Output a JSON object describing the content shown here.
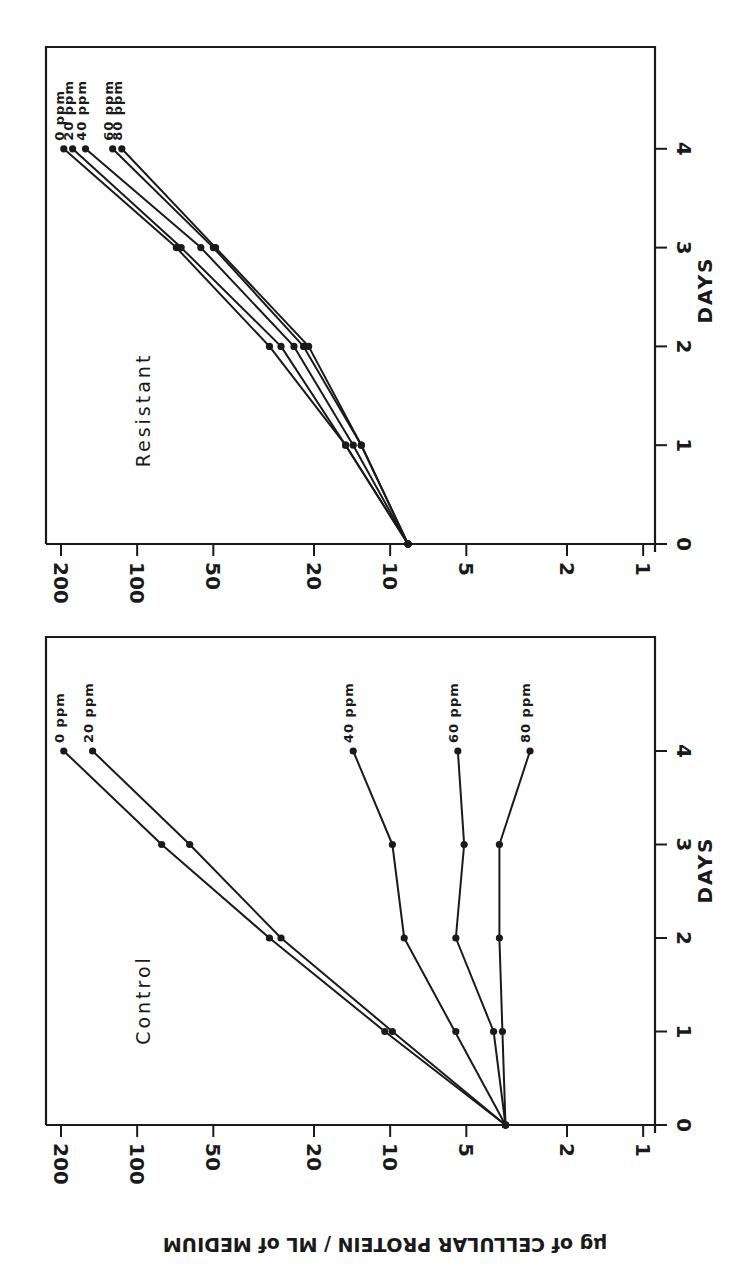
{
  "figure": {
    "orientation_note": "figure printed rotated 90 degrees clockwise",
    "y_axis_title": "µg of CELLULAR PROTEIN / ML of MEDIUM",
    "x_axis_title": "DAYS",
    "colors": {
      "ink": "#1a1a1a",
      "background": "#ffffff"
    }
  },
  "chart_data": [
    {
      "type": "line",
      "title": "Resistant",
      "xlabel": "DAYS",
      "ylabel": "µg of CELLULAR PROTEIN / ML of MEDIUM",
      "x": [
        0,
        1,
        2,
        3,
        4
      ],
      "x_ticks": [
        "0",
        "1",
        "2",
        "3",
        "4"
      ],
      "xlim": [
        0,
        5
      ],
      "y_scale": "log",
      "y_ticks": [
        "1",
        "2",
        "5",
        "10",
        "20",
        "50",
        "100",
        "200"
      ],
      "ylim": [
        1,
        220
      ],
      "grid": false,
      "legend": "inline labels at line ends",
      "series": [
        {
          "name": "0 ppm",
          "values": [
            8.5,
            15,
            30,
            70,
            195
          ]
        },
        {
          "name": "20 ppm",
          "values": [
            8.5,
            15,
            27,
            67,
            180
          ]
        },
        {
          "name": "40 ppm",
          "values": [
            8.5,
            14,
            24,
            56,
            160
          ]
        },
        {
          "name": "60 ppm",
          "values": [
            8.5,
            13,
            22,
            50,
            125
          ]
        },
        {
          "name": "80 ppm",
          "values": [
            8.5,
            13,
            21,
            49,
            115
          ]
        }
      ]
    },
    {
      "type": "line",
      "title": "Control",
      "xlabel": "DAYS",
      "ylabel": "µg of CELLULAR PROTEIN / ML of MEDIUM",
      "x": [
        0,
        1,
        2,
        3,
        4
      ],
      "x_ticks": [
        "0",
        "1",
        "2",
        "3",
        "4"
      ],
      "xlim": [
        0,
        5
      ],
      "y_scale": "log",
      "y_ticks": [
        "1",
        "2",
        "5",
        "10",
        "20",
        "50",
        "100",
        "200"
      ],
      "ylim": [
        1,
        220
      ],
      "grid": false,
      "legend": "inline labels at line ends",
      "series": [
        {
          "name": "0 ppm",
          "values": [
            3.5,
            10.5,
            30,
            80,
            195
          ]
        },
        {
          "name": "20 ppm",
          "values": [
            3.5,
            9.8,
            27,
            62,
            150
          ]
        },
        {
          "name": "40 ppm",
          "values": [
            3.5,
            5.5,
            8.8,
            9.8,
            14
          ],
          "note": "day-1 point plotted off the connecting line"
        },
        {
          "name": "60 ppm",
          "values": [
            3.5,
            3.9,
            5.5,
            5.1,
            5.4
          ]
        },
        {
          "name": "80 ppm",
          "values": [
            3.5,
            3.6,
            3.7,
            3.7,
            2.8
          ]
        }
      ]
    }
  ]
}
